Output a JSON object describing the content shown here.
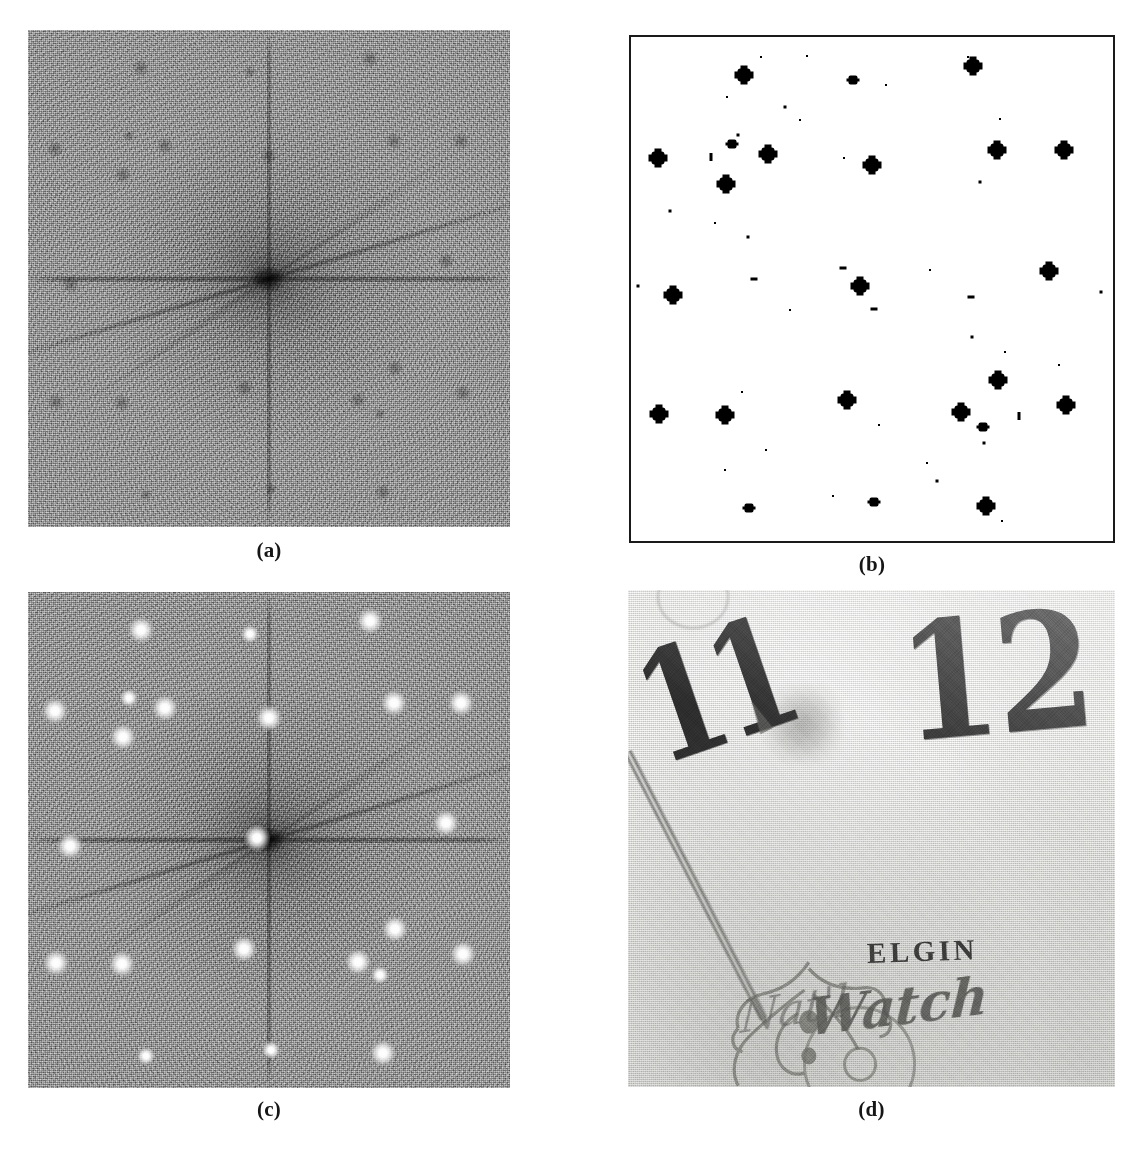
{
  "figure": {
    "panels": [
      {
        "id": "a",
        "label": "(a)",
        "kind": "fourier-magnitude-spectrum",
        "description": "Fourier magnitude spectrum of the scanned halftone image, noisy grey field with dark DC peak and cross-shaped streaks"
      },
      {
        "id": "b",
        "label": "(b)",
        "kind": "binary-peak-map",
        "description": "Thresholded binary peak-detection map, black detected peaks on white background with thin rectangular border"
      },
      {
        "id": "c",
        "label": "(c)",
        "kind": "spectrum-with-detected-peaks",
        "description": "Same magnitude spectrum with the detected screen frequency peaks marked as bright white dots"
      },
      {
        "id": "d",
        "label": "(d)",
        "kind": "watch-face-photograph",
        "description": "Grayscale photograph of an Elgin pocket watch dial showing the numerals 11 and 12, the hour hand and engraved lettering"
      }
    ]
  },
  "watch_face": {
    "numeral_eleven": "11",
    "numeral_twelve": "12",
    "brand": "ELGIN",
    "script_line": "Watch",
    "script_prefix": "Nat'l"
  },
  "colors": {
    "page_background": "#ffffff",
    "spectrum_base": "#8d8d8d",
    "peak_white": "#ffffff",
    "binary_black": "#000000",
    "border": "#1a1a1a",
    "dial_paper": "#ececea",
    "ink": "#2c2c2c",
    "caption_text": "#161616"
  },
  "chart_data": {
    "type": "scatter",
    "xlabel": "horizontal frequency (normalised)",
    "ylabel": "vertical frequency (normalised)",
    "xlim": [
      0,
      100
    ],
    "ylim": [
      0,
      100
    ],
    "grid": false,
    "legend": "none",
    "note": "Coordinates are percentages of the square panel; strength classes are big / mid / small / tiny / dot / dash / bar as rendered in panel (b) and mirrored as bright peaks in panel (c).",
    "series": [
      {
        "name": "strong detected peaks (panel b black blobs, panel c white dots)",
        "points": [
          {
            "x": 23.4,
            "y": 7.6,
            "strength": "big"
          },
          {
            "x": 70.9,
            "y": 5.8,
            "strength": "big"
          },
          {
            "x": 46.0,
            "y": 8.5,
            "strength": "mid"
          },
          {
            "x": 5.5,
            "y": 24.0,
            "strength": "big"
          },
          {
            "x": 21.0,
            "y": 21.3,
            "strength": "mid"
          },
          {
            "x": 28.5,
            "y": 23.3,
            "strength": "big"
          },
          {
            "x": 50.0,
            "y": 25.4,
            "strength": "big"
          },
          {
            "x": 76.0,
            "y": 22.4,
            "strength": "big"
          },
          {
            "x": 89.8,
            "y": 22.4,
            "strength": "big"
          },
          {
            "x": 19.7,
            "y": 29.2,
            "strength": "big"
          },
          {
            "x": 86.8,
            "y": 46.5,
            "strength": "big"
          },
          {
            "x": 47.6,
            "y": 49.5,
            "strength": "big"
          },
          {
            "x": 8.8,
            "y": 51.2,
            "strength": "big"
          },
          {
            "x": 76.2,
            "y": 68.0,
            "strength": "big"
          },
          {
            "x": 44.9,
            "y": 72.0,
            "strength": "big"
          },
          {
            "x": 5.8,
            "y": 74.8,
            "strength": "big"
          },
          {
            "x": 19.5,
            "y": 75.0,
            "strength": "big"
          },
          {
            "x": 68.4,
            "y": 74.5,
            "strength": "big"
          },
          {
            "x": 90.2,
            "y": 73.0,
            "strength": "big"
          },
          {
            "x": 73.0,
            "y": 77.3,
            "strength": "mid"
          },
          {
            "x": 24.5,
            "y": 93.5,
            "strength": "mid"
          },
          {
            "x": 73.7,
            "y": 93.0,
            "strength": "big"
          },
          {
            "x": 50.5,
            "y": 92.3,
            "strength": "mid"
          }
        ]
      },
      {
        "name": "weak residual responses (panel b speckle)",
        "points": [
          {
            "x": 27.0,
            "y": 4.0,
            "strength": "dot"
          },
          {
            "x": 36.5,
            "y": 3.8,
            "strength": "dot"
          },
          {
            "x": 70.0,
            "y": 4.0,
            "strength": "dot"
          },
          {
            "x": 53.0,
            "y": 9.5,
            "strength": "dot"
          },
          {
            "x": 20.0,
            "y": 12.0,
            "strength": "dot"
          },
          {
            "x": 32.0,
            "y": 13.8,
            "strength": "tiny"
          },
          {
            "x": 35.0,
            "y": 16.5,
            "strength": "dot"
          },
          {
            "x": 76.5,
            "y": 16.3,
            "strength": "dot"
          },
          {
            "x": 22.2,
            "y": 19.5,
            "strength": "tiny"
          },
          {
            "x": 16.5,
            "y": 23.8,
            "strength": "bar"
          },
          {
            "x": 44.2,
            "y": 24.0,
            "strength": "dot"
          },
          {
            "x": 72.5,
            "y": 28.8,
            "strength": "tiny"
          },
          {
            "x": 8.0,
            "y": 34.5,
            "strength": "tiny"
          },
          {
            "x": 17.5,
            "y": 37.0,
            "strength": "dot"
          },
          {
            "x": 24.3,
            "y": 39.6,
            "strength": "tiny"
          },
          {
            "x": 44.0,
            "y": 45.8,
            "strength": "dash"
          },
          {
            "x": 62.0,
            "y": 46.2,
            "strength": "dot"
          },
          {
            "x": 25.5,
            "y": 48.0,
            "strength": "dash"
          },
          {
            "x": 1.5,
            "y": 49.5,
            "strength": "tiny"
          },
          {
            "x": 70.5,
            "y": 51.5,
            "strength": "dash"
          },
          {
            "x": 50.5,
            "y": 54.0,
            "strength": "dash"
          },
          {
            "x": 33.0,
            "y": 54.2,
            "strength": "dot"
          },
          {
            "x": 97.5,
            "y": 50.5,
            "strength": "tiny"
          },
          {
            "x": 70.8,
            "y": 59.5,
            "strength": "tiny"
          },
          {
            "x": 77.5,
            "y": 62.5,
            "strength": "dot"
          },
          {
            "x": 88.7,
            "y": 65.0,
            "strength": "dot"
          },
          {
            "x": 23.0,
            "y": 70.5,
            "strength": "dot"
          },
          {
            "x": 80.5,
            "y": 75.2,
            "strength": "bar"
          },
          {
            "x": 51.5,
            "y": 77.0,
            "strength": "dot"
          },
          {
            "x": 73.2,
            "y": 80.5,
            "strength": "tiny"
          },
          {
            "x": 28.0,
            "y": 82.0,
            "strength": "dot"
          },
          {
            "x": 61.5,
            "y": 84.5,
            "strength": "dot"
          },
          {
            "x": 19.5,
            "y": 86.0,
            "strength": "dot"
          },
          {
            "x": 63.5,
            "y": 88.0,
            "strength": "tiny"
          },
          {
            "x": 42.0,
            "y": 91.0,
            "strength": "dot"
          },
          {
            "x": 77.0,
            "y": 96.0,
            "strength": "dot"
          }
        ]
      }
    ]
  }
}
